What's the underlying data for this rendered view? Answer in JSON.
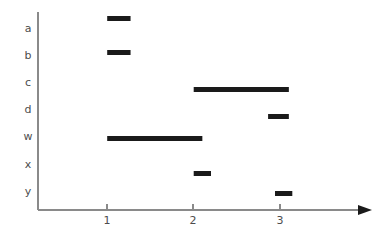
{
  "chart_data": {
    "type": "bar",
    "orientation": "horizontal",
    "title": "",
    "subtitle": "",
    "xlabel": "",
    "ylabel": "",
    "grid": false,
    "legend": false,
    "xlim": [
      0.3,
      3.85
    ],
    "x_ticks": [
      1,
      2,
      3
    ],
    "x_tick_labels": [
      "1",
      "2",
      "3"
    ],
    "categories": [
      "a",
      "b",
      "c",
      "d",
      "w",
      "x",
      "y"
    ],
    "category_labels": [
      "a",
      "b",
      "c",
      "d",
      "w",
      "x",
      "y"
    ],
    "axis_arrow": true,
    "bar_color": "#1a1a1a",
    "axis_color": "#8a8a8a",
    "label_color": "#4d4d4d",
    "bars": [
      {
        "category": "a",
        "start": 1.0,
        "end": 1.27,
        "duration": 0.27
      },
      {
        "category": "b",
        "start": 1.0,
        "end": 1.27,
        "duration": 0.27
      },
      {
        "category": "c",
        "start": 2.0,
        "end": 3.1,
        "duration": 1.1
      },
      {
        "category": "d",
        "start": 2.86,
        "end": 3.1,
        "duration": 0.24
      },
      {
        "category": "w",
        "start": 1.0,
        "end": 2.1,
        "duration": 1.1
      },
      {
        "category": "x",
        "start": 2.0,
        "end": 2.2,
        "duration": 0.2
      },
      {
        "category": "y",
        "start": 2.94,
        "end": 3.14,
        "duration": 0.2
      }
    ]
  },
  "geometry": {
    "plot_left": 38,
    "plot_bottom": 210,
    "plot_right": 372,
    "plot_top": 12,
    "x_origin_px": 38,
    "x_unit_px": 86.5,
    "x_value_at_origin": 0.2,
    "row_y_px": [
      16,
      50,
      87,
      114,
      136,
      171,
      191
    ],
    "label_y_px": [
      29,
      56,
      83,
      110,
      137,
      165,
      192
    ],
    "bar_height_px": 5,
    "tick_x_px": [
      107,
      193,
      280
    ],
    "tick_len_px": 6,
    "xlabel_y_px": 216,
    "ylabel_x_px": 28,
    "arrow_tip_x_px": 372,
    "arrow_back_x_px": 358,
    "arrow_half_h_px": 5
  }
}
